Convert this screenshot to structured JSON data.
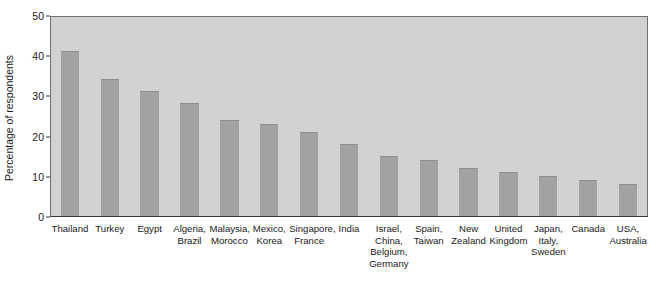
{
  "chart_data": {
    "type": "bar",
    "title": "",
    "subtitle": "",
    "xlabel": "",
    "ylabel": "Percentage of respondents",
    "ylim": [
      0,
      50
    ],
    "yticks": [
      0,
      10,
      20,
      30,
      40,
      50
    ],
    "grid": false,
    "legend": false,
    "orientation": "vertical",
    "categories": [
      "Thailand",
      "Turkey",
      "Egypt",
      "Algeria,\nBrazil",
      "Malaysia,\nMorocco",
      "Mexico,\nKorea",
      "Singapore,\nFrance",
      "India",
      "Israel,\nChina,\nBelgium,\nGermany",
      "Spain,\nTaiwan",
      "New\nZealand",
      "United\nKingdom",
      "Japan,\nItaly,\nSweden",
      "Canada",
      "USA,\nAustralia"
    ],
    "values": [
      41,
      34,
      31,
      28,
      24,
      23,
      21,
      18,
      15,
      14,
      12,
      11,
      10,
      9,
      8
    ],
    "colors": {
      "bar_fill": "#a2a2a2",
      "plot_background": "#d2d2d2",
      "figure_background": "#ffffff",
      "axis_line": "#3a3a3a",
      "plot_border": "#6f6f6f",
      "text": "#1a1a1a"
    }
  }
}
